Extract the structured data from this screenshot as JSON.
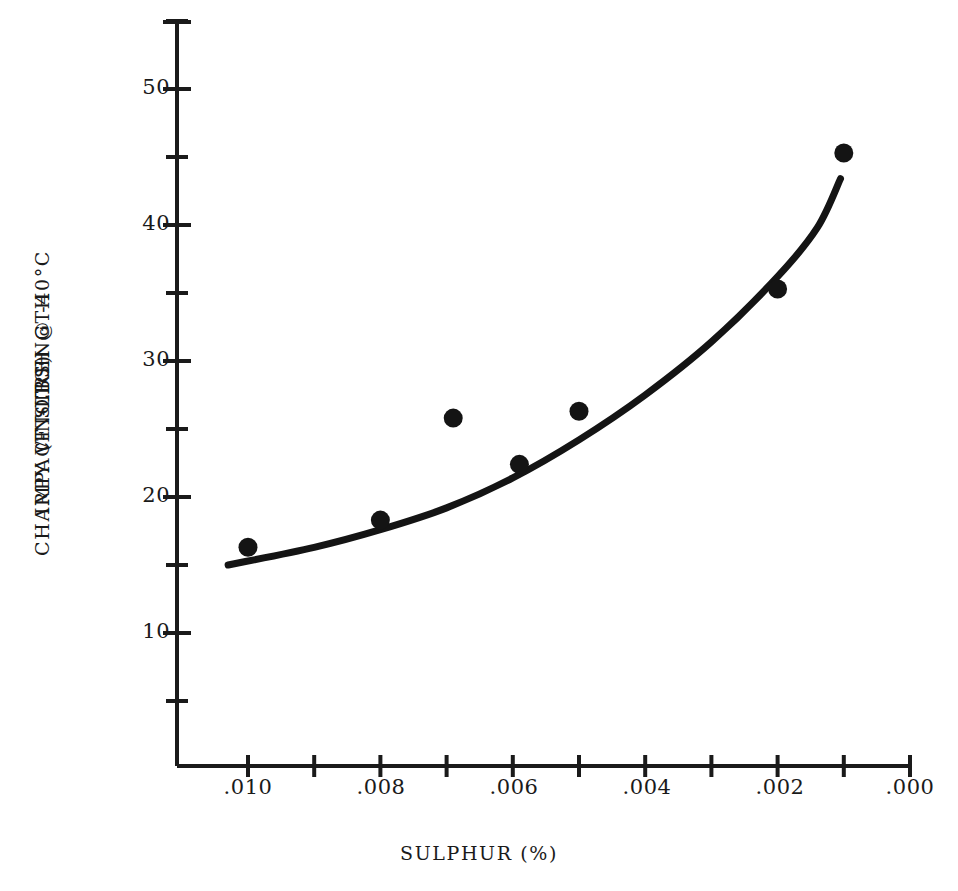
{
  "chart_data": {
    "type": "scatter",
    "title": "",
    "xlabel": "SULPHUR (%)",
    "ylabel_lines": [
      "IMPACT STRENGTH",
      "CHARPY V-NOTCH @ -40°C",
      "(FT-LBS)"
    ],
    "ylabel": "IMPACT STRENGTH CHARPY V-NOTCH @ -40°C (FT-LBS)",
    "x_tick_labels": [
      ".010",
      ".008",
      ".006",
      ".004",
      ".002",
      ".000"
    ],
    "x_tick_values": [
      0.01,
      0.008,
      0.006,
      0.004,
      0.002,
      0.0
    ],
    "x_minor_tick_values": [
      0.009,
      0.007,
      0.005,
      0.003,
      0.001
    ],
    "y_tick_labels": [
      "50",
      "40",
      "30",
      "20",
      "10"
    ],
    "y_tick_values": [
      50,
      40,
      30,
      20,
      10
    ],
    "y_minor_tick_values": [
      55,
      45,
      35,
      25,
      15,
      5
    ],
    "xlim": [
      0.0105,
      0.0
    ],
    "ylim": [
      0,
      55
    ],
    "x_axis_inverted": true,
    "grid": false,
    "legend": false,
    "series": [
      {
        "name": "Measured impact strength",
        "marker": "filled-circle",
        "points": [
          {
            "x": 0.01,
            "y": 16.3
          },
          {
            "x": 0.008,
            "y": 18.3
          },
          {
            "x": 0.0069,
            "y": 25.8
          },
          {
            "x": 0.0059,
            "y": 22.4
          },
          {
            "x": 0.005,
            "y": 26.3
          },
          {
            "x": 0.002,
            "y": 35.3
          },
          {
            "x": 0.001,
            "y": 45.3
          }
        ]
      },
      {
        "name": "Fitted trend curve",
        "marker": "none",
        "style": "solid-thick",
        "points": [
          {
            "x": 0.0103,
            "y": 15.0
          },
          {
            "x": 0.009,
            "y": 16.3
          },
          {
            "x": 0.008,
            "y": 17.6
          },
          {
            "x": 0.007,
            "y": 19.2
          },
          {
            "x": 0.006,
            "y": 21.4
          },
          {
            "x": 0.005,
            "y": 24.2
          },
          {
            "x": 0.004,
            "y": 27.5
          },
          {
            "x": 0.003,
            "y": 31.4
          },
          {
            "x": 0.002,
            "y": 36.2
          },
          {
            "x": 0.0014,
            "y": 39.8
          },
          {
            "x": 0.00105,
            "y": 43.4
          }
        ]
      }
    ]
  },
  "colors": {
    "ink": "#1a1a1a",
    "background": "#ffffff",
    "curve": "#141414",
    "marker": "#141414"
  }
}
